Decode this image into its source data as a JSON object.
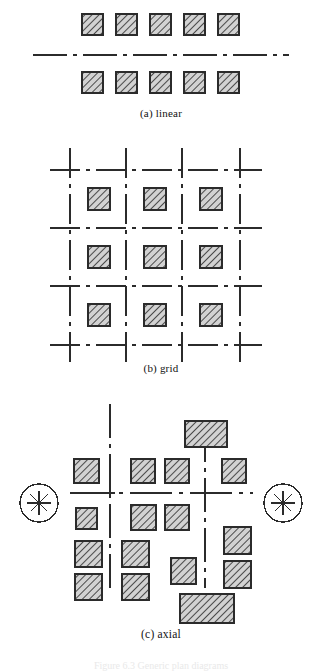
{
  "figure": {
    "background": "#ffffff",
    "ink": "#2b2b2b",
    "hatch_fill": "#c9c9c9",
    "panels": [
      {
        "id": "linear",
        "caption": "(a) linear",
        "description": "Two rows of five hatched square blocks separated by a horizontal dash-dot centre line.",
        "centerline": {
          "type": "dash-dot",
          "orientation": "horizontal",
          "x1": 33,
          "x2": 289,
          "y": 55
        },
        "blocks_top": [
          {
            "x": 82,
            "y": 14,
            "w": 21,
            "h": 21
          },
          {
            "x": 116,
            "y": 14,
            "w": 21,
            "h": 21
          },
          {
            "x": 150,
            "y": 14,
            "w": 21,
            "h": 21
          },
          {
            "x": 184,
            "y": 14,
            "w": 21,
            "h": 21
          },
          {
            "x": 218,
            "y": 14,
            "w": 21,
            "h": 21
          }
        ],
        "blocks_bottom": [
          {
            "x": 82,
            "y": 72,
            "w": 21,
            "h": 21
          },
          {
            "x": 116,
            "y": 72,
            "w": 21,
            "h": 21
          },
          {
            "x": 150,
            "y": 72,
            "w": 21,
            "h": 21
          },
          {
            "x": 184,
            "y": 72,
            "w": 21,
            "h": 21
          },
          {
            "x": 218,
            "y": 72,
            "w": 21,
            "h": 21
          }
        ]
      },
      {
        "id": "grid",
        "caption": "(b) grid",
        "description": "Four vertical and four horizontal dash-dot axes forming a grid, with a hatched square block centred in each of the nine cells.",
        "v_axes_x": [
          70,
          126,
          182,
          240
        ],
        "h_axes_y": [
          170,
          228,
          286,
          345
        ],
        "axis_extent": {
          "x1": 50,
          "x2": 262,
          "y1": 148,
          "y2": 366
        },
        "blocks": [
          {
            "x": 88,
            "y": 188,
            "w": 22,
            "h": 22
          },
          {
            "x": 144,
            "y": 188,
            "w": 22,
            "h": 22
          },
          {
            "x": 200,
            "y": 188,
            "w": 22,
            "h": 22
          },
          {
            "x": 88,
            "y": 246,
            "w": 22,
            "h": 22
          },
          {
            "x": 144,
            "y": 246,
            "w": 22,
            "h": 22
          },
          {
            "x": 200,
            "y": 246,
            "w": 22,
            "h": 22
          },
          {
            "x": 88,
            "y": 304,
            "w": 22,
            "h": 22
          },
          {
            "x": 144,
            "y": 304,
            "w": 22,
            "h": 22
          },
          {
            "x": 200,
            "y": 304,
            "w": 22,
            "h": 22
          }
        ]
      },
      {
        "id": "axial",
        "caption": "(c) axial",
        "description": "A central dash-dot cross axis flanked by two circled asterisk vista markers, with irregularly placed hatched blocks of differing sizes around the axes.",
        "main_axis": {
          "y": 493,
          "x1": 70,
          "x2": 253
        },
        "v_axes_x": [
          110,
          205
        ],
        "v_axis_span": {
          "y1": 404,
          "y2": 588
        },
        "crosshairs": [
          {
            "x": 110,
            "y": 493
          },
          {
            "x": 205,
            "y": 493
          }
        ],
        "vista_markers": [
          {
            "name": "left-vista-marker",
            "cx": 39,
            "cy": 503,
            "r": 19,
            "glyph": "asterisk"
          },
          {
            "name": "right-vista-marker",
            "cx": 283,
            "cy": 503,
            "r": 19,
            "glyph": "asterisk"
          }
        ],
        "blocks": [
          {
            "x": 185,
            "y": 421,
            "w": 42,
            "h": 26
          },
          {
            "x": 74,
            "y": 459,
            "w": 25,
            "h": 24
          },
          {
            "x": 131,
            "y": 459,
            "w": 24,
            "h": 24
          },
          {
            "x": 165,
            "y": 459,
            "w": 24,
            "h": 24
          },
          {
            "x": 222,
            "y": 459,
            "w": 24,
            "h": 24
          },
          {
            "x": 76,
            "y": 508,
            "w": 21,
            "h": 21
          },
          {
            "x": 131,
            "y": 505,
            "w": 25,
            "h": 25
          },
          {
            "x": 165,
            "y": 505,
            "w": 24,
            "h": 25
          },
          {
            "x": 224,
            "y": 527,
            "w": 27,
            "h": 27
          },
          {
            "x": 75,
            "y": 541,
            "w": 27,
            "h": 26
          },
          {
            "x": 122,
            "y": 541,
            "w": 27,
            "h": 26
          },
          {
            "x": 171,
            "y": 558,
            "w": 25,
            "h": 26
          },
          {
            "x": 224,
            "y": 561,
            "w": 27,
            "h": 27
          },
          {
            "x": 75,
            "y": 574,
            "w": 27,
            "h": 26
          },
          {
            "x": 122,
            "y": 574,
            "w": 27,
            "h": 26
          },
          {
            "x": 180,
            "y": 594,
            "w": 54,
            "h": 29
          }
        ]
      }
    ],
    "figure_caption": "Figure 6.3  Generic plan diagrams"
  }
}
